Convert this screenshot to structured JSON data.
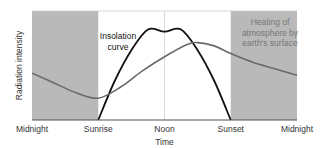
{
  "chart_data": {
    "type": "line",
    "title": "",
    "xlabel": "Time",
    "ylabel": "Radiation intensity",
    "x_ticks": [
      {
        "label": "Midnight",
        "t": 0
      },
      {
        "label": "Sunrise",
        "t": 6
      },
      {
        "label": "Noon",
        "t": 12
      },
      {
        "label": "Sunset",
        "t": 18
      },
      {
        "label": "Midnight",
        "t": 24
      }
    ],
    "xlim": [
      0,
      24
    ],
    "ylim": [
      0,
      1
    ],
    "shaded_regions": [
      {
        "name": "night-before-sunrise",
        "from": 0,
        "to": 6,
        "color": "#b9b9b9"
      },
      {
        "name": "night-after-sunset",
        "from": 18,
        "to": 24,
        "color": "#b9b9b9"
      }
    ],
    "noon_marker": 12,
    "series": [
      {
        "name": "Insolation curve",
        "color": "#111111",
        "points": [
          [
            6,
            0
          ],
          [
            7.5,
            0.36
          ],
          [
            9,
            0.64
          ],
          [
            10.5,
            0.83
          ],
          [
            12,
            0.81
          ],
          [
            13.5,
            0.83
          ],
          [
            15,
            0.64
          ],
          [
            16.5,
            0.36
          ],
          [
            18,
            0
          ]
        ]
      },
      {
        "name": "Heating of atmosphere by earth's surface",
        "color": "#6a6a6a",
        "points": [
          [
            0,
            0.43
          ],
          [
            2,
            0.34
          ],
          [
            4,
            0.25
          ],
          [
            6,
            0.2
          ],
          [
            8,
            0.3
          ],
          [
            10,
            0.45
          ],
          [
            12,
            0.58
          ],
          [
            14,
            0.69
          ],
          [
            15,
            0.71
          ],
          [
            16.5,
            0.68
          ],
          [
            18,
            0.61
          ],
          [
            20,
            0.53
          ],
          [
            22,
            0.47
          ],
          [
            24,
            0.41
          ]
        ]
      }
    ],
    "annotations": [
      {
        "lines": [
          "Insolation",
          "curve"
        ],
        "color": "#111111"
      },
      {
        "lines": [
          "Heating of",
          "atmosphere by",
          "earth's surface"
        ],
        "color": "#777777"
      }
    ]
  }
}
